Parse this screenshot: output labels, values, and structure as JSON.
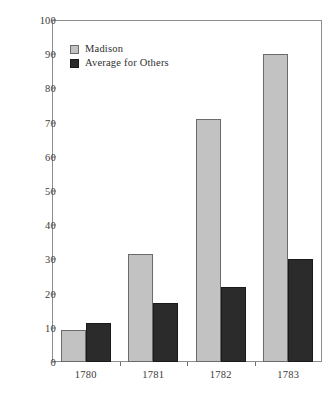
{
  "chart_data": {
    "type": "bar",
    "title": "",
    "subtitle": "",
    "xlabel": "",
    "ylabel": "",
    "categories": [
      "1780",
      "1781",
      "1782",
      "1783"
    ],
    "series": [
      {
        "name": "Madison",
        "values": [
          9.3,
          31.5,
          71.0,
          90.0
        ],
        "color": "#c2c2c2"
      },
      {
        "name": "Average for Others",
        "values": [
          11.4,
          17.3,
          22.0,
          30.0
        ],
        "color": "#2b2b2b"
      }
    ],
    "ylim": [
      0,
      100
    ],
    "yticks": [
      0,
      10,
      20,
      30,
      40,
      50,
      60,
      70,
      80,
      90,
      100
    ],
    "ytick_labels": [
      "0",
      "10",
      "20",
      "30",
      "40",
      "50",
      "60",
      "70",
      "80",
      "90",
      "100"
    ],
    "grid": false,
    "legend_position": "upper-left",
    "legend": [
      "Madison",
      "Average for Others"
    ]
  },
  "legend": {
    "items": [
      {
        "label": "Madison",
        "swatch": "light-gray-swatch"
      },
      {
        "label": "Average for Others",
        "swatch": "dark-swatch"
      }
    ]
  },
  "caption": {
    "text": ""
  },
  "colors": {
    "madison": "#c2c2c2",
    "others": "#2b2b2b",
    "axis": "#8d8d8d",
    "text": "#2f2f2f",
    "background": "#ffffff"
  }
}
